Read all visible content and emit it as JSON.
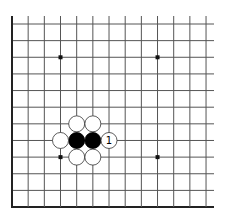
{
  "board": {
    "description": "Go board diagram - lower-left corner of 19x19",
    "cols": 13,
    "rows": 12,
    "origin_x": 12,
    "origin_y": 24,
    "col_spacing": 16.17,
    "row_spacing": 16.64,
    "line_extend_right": 214,
    "line_extend_top": 16,
    "edge_left": true,
    "edge_bottom": true,
    "line_color": "#555555",
    "edge_color": "#222222",
    "star_points": [
      {
        "col": 3,
        "row": 2
      },
      {
        "col": 9,
        "row": 2
      },
      {
        "col": 3,
        "row": 8
      },
      {
        "col": 9,
        "row": 8
      }
    ],
    "stones": [
      {
        "color": "black",
        "col": 4,
        "row": 7
      },
      {
        "color": "black",
        "col": 5,
        "row": 7
      },
      {
        "color": "white",
        "col": 4,
        "row": 6
      },
      {
        "color": "white",
        "col": 5,
        "row": 6
      },
      {
        "color": "white",
        "col": 3,
        "row": 7
      },
      {
        "color": "white",
        "col": 4,
        "row": 8
      },
      {
        "color": "white",
        "col": 5,
        "row": 8
      },
      {
        "color": "white",
        "col": 6,
        "row": 7,
        "label": "1"
      }
    ]
  }
}
